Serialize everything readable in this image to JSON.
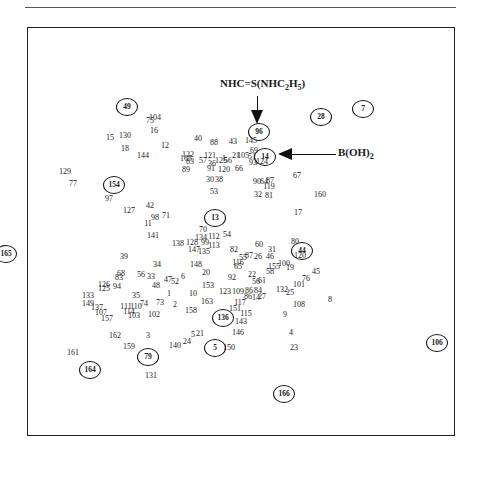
{
  "figure": {
    "annotations": {
      "top": {
        "main": "NHC=S(NHC",
        "sub1": "2",
        "mid": "H",
        "sub2": "5",
        "end": ")"
      },
      "right": {
        "main": "B(OH)",
        "sub": "2"
      }
    }
  },
  "chart_data": {
    "type": "scatter",
    "title": "",
    "xlabel": "",
    "ylabel": "",
    "grid": false,
    "legend": "none",
    "annotations": [
      {
        "text": "NHC=S(NHC2H5)",
        "points_to": "96"
      },
      {
        "text": "B(OH)2",
        "points_to": "14"
      }
    ],
    "points": [
      {
        "label": "49",
        "x": 127,
        "y": 107,
        "circled": true
      },
      {
        "label": "104",
        "x": 155,
        "y": 118
      },
      {
        "label": "75",
        "x": 150,
        "y": 121
      },
      {
        "label": "16",
        "x": 154,
        "y": 131
      },
      {
        "label": "15",
        "x": 110,
        "y": 138
      },
      {
        "label": "130",
        "x": 125,
        "y": 136
      },
      {
        "label": "12",
        "x": 165,
        "y": 146
      },
      {
        "label": "18",
        "x": 125,
        "y": 149
      },
      {
        "label": "144",
        "x": 143,
        "y": 156
      },
      {
        "label": "40",
        "x": 198,
        "y": 139
      },
      {
        "label": "88",
        "x": 214,
        "y": 143
      },
      {
        "label": "43",
        "x": 233,
        "y": 142
      },
      {
        "label": "145",
        "x": 251,
        "y": 141
      },
      {
        "label": "96",
        "x": 259,
        "y": 132,
        "circled": true
      },
      {
        "label": "28",
        "x": 321,
        "y": 117,
        "circled": true
      },
      {
        "label": "7",
        "x": 363,
        "y": 109,
        "circled": true
      },
      {
        "label": "69",
        "x": 254,
        "y": 151
      },
      {
        "label": "14",
        "x": 265,
        "y": 157,
        "circled": true
      },
      {
        "label": "122",
        "x": 188,
        "y": 155
      },
      {
        "label": "165",
        "x": 186,
        "y": 159
      },
      {
        "label": "83",
        "x": 190,
        "y": 162
      },
      {
        "label": "57",
        "x": 203,
        "y": 161
      },
      {
        "label": "121",
        "x": 210,
        "y": 156
      },
      {
        "label": "36",
        "x": 212,
        "y": 164
      },
      {
        "label": "125",
        "x": 221,
        "y": 161
      },
      {
        "label": "1",
        "x": 224,
        "y": 159
      },
      {
        "label": "56",
        "x": 228,
        "y": 161
      },
      {
        "label": "21",
        "x": 236,
        "y": 156
      },
      {
        "label": "105",
        "x": 243,
        "y": 156
      },
      {
        "label": "51",
        "x": 252,
        "y": 157
      },
      {
        "label": "93",
        "x": 253,
        "y": 163
      },
      {
        "label": "124",
        "x": 262,
        "y": 162
      },
      {
        "label": "89",
        "x": 186,
        "y": 170
      },
      {
        "label": "91",
        "x": 211,
        "y": 169
      },
      {
        "label": "120",
        "x": 224,
        "y": 170
      },
      {
        "label": "66",
        "x": 239,
        "y": 169
      },
      {
        "label": "67",
        "x": 297,
        "y": 176
      },
      {
        "label": "129",
        "x": 65,
        "y": 172
      },
      {
        "label": "77",
        "x": 73,
        "y": 184
      },
      {
        "label": "154",
        "x": 114,
        "y": 185,
        "circled": true
      },
      {
        "label": "97",
        "x": 109,
        "y": 199
      },
      {
        "label": "30",
        "x": 210,
        "y": 180
      },
      {
        "label": "38",
        "x": 219,
        "y": 180
      },
      {
        "label": "90",
        "x": 257,
        "y": 182
      },
      {
        "label": "64",
        "x": 264,
        "y": 182
      },
      {
        "label": "87",
        "x": 270,
        "y": 181
      },
      {
        "label": "119",
        "x": 269,
        "y": 187
      },
      {
        "label": "53",
        "x": 214,
        "y": 192
      },
      {
        "label": "32",
        "x": 258,
        "y": 195
      },
      {
        "label": "81",
        "x": 269,
        "y": 196
      },
      {
        "label": "160",
        "x": 320,
        "y": 195
      },
      {
        "label": "127",
        "x": 129,
        "y": 211
      },
      {
        "label": "42",
        "x": 150,
        "y": 206
      },
      {
        "label": "98",
        "x": 155,
        "y": 218
      },
      {
        "label": "71",
        "x": 166,
        "y": 216
      },
      {
        "label": "11",
        "x": 148,
        "y": 224
      },
      {
        "label": "13",
        "x": 215,
        "y": 218,
        "circled": true
      },
      {
        "label": "17",
        "x": 298,
        "y": 213
      },
      {
        "label": "141",
        "x": 153,
        "y": 236
      },
      {
        "label": "70",
        "x": 203,
        "y": 230
      },
      {
        "label": "54",
        "x": 227,
        "y": 235
      },
      {
        "label": "134",
        "x": 201,
        "y": 238
      },
      {
        "label": "112",
        "x": 214,
        "y": 237
      },
      {
        "label": "138",
        "x": 178,
        "y": 244
      },
      {
        "label": "128",
        "x": 192,
        "y": 243
      },
      {
        "label": "99",
        "x": 205,
        "y": 243
      },
      {
        "label": "113",
        "x": 214,
        "y": 246
      },
      {
        "label": "147",
        "x": 194,
        "y": 250
      },
      {
        "label": "135",
        "x": 204,
        "y": 252
      },
      {
        "label": "82",
        "x": 234,
        "y": 250
      },
      {
        "label": "60",
        "x": 259,
        "y": 245
      },
      {
        "label": "31",
        "x": 272,
        "y": 250
      },
      {
        "label": "80",
        "x": 295,
        "y": 242
      },
      {
        "label": "44",
        "x": 302,
        "y": 251,
        "circled": true
      },
      {
        "label": "120",
        "x": 300,
        "y": 256
      },
      {
        "label": "55",
        "x": 243,
        "y": 258
      },
      {
        "label": "87",
        "x": 249,
        "y": 256
      },
      {
        "label": "26",
        "x": 258,
        "y": 257
      },
      {
        "label": "46",
        "x": 270,
        "y": 257
      },
      {
        "label": "165",
        "x": 6,
        "y": 254,
        "circled": true
      },
      {
        "label": "39",
        "x": 124,
        "y": 257
      },
      {
        "label": "34",
        "x": 157,
        "y": 265
      },
      {
        "label": "148",
        "x": 196,
        "y": 265
      },
      {
        "label": "116",
        "x": 238,
        "y": 263
      },
      {
        "label": "65",
        "x": 238,
        "y": 267
      },
      {
        "label": "155",
        "x": 274,
        "y": 267
      },
      {
        "label": "100",
        "x": 284,
        "y": 264
      },
      {
        "label": "19",
        "x": 290,
        "y": 268
      },
      {
        "label": "58",
        "x": 270,
        "y": 272
      },
      {
        "label": "45",
        "x": 316,
        "y": 272
      },
      {
        "label": "68",
        "x": 121,
        "y": 274
      },
      {
        "label": "83",
        "x": 119,
        "y": 278
      },
      {
        "label": "56",
        "x": 141,
        "y": 275
      },
      {
        "label": "33",
        "x": 151,
        "y": 277
      },
      {
        "label": "47",
        "x": 168,
        "y": 280
      },
      {
        "label": "52",
        "x": 175,
        "y": 282
      },
      {
        "label": "6",
        "x": 183,
        "y": 277
      },
      {
        "label": "20",
        "x": 206,
        "y": 273
      },
      {
        "label": "92",
        "x": 232,
        "y": 278
      },
      {
        "label": "22",
        "x": 252,
        "y": 275
      },
      {
        "label": "56",
        "x": 256,
        "y": 282
      },
      {
        "label": "61",
        "x": 262,
        "y": 281
      },
      {
        "label": "76",
        "x": 306,
        "y": 279
      },
      {
        "label": "8",
        "x": 330,
        "y": 300
      },
      {
        "label": "126",
        "x": 104,
        "y": 285
      },
      {
        "label": "125",
        "x": 104,
        "y": 289
      },
      {
        "label": "94",
        "x": 117,
        "y": 287
      },
      {
        "label": "48",
        "x": 156,
        "y": 286
      },
      {
        "label": "153",
        "x": 208,
        "y": 286
      },
      {
        "label": "101",
        "x": 299,
        "y": 285
      },
      {
        "label": "132",
        "x": 282,
        "y": 290
      },
      {
        "label": "25",
        "x": 290,
        "y": 293
      },
      {
        "label": "133",
        "x": 88,
        "y": 296
      },
      {
        "label": "35",
        "x": 136,
        "y": 296
      },
      {
        "label": "1",
        "x": 169,
        "y": 294
      },
      {
        "label": "10",
        "x": 193,
        "y": 294
      },
      {
        "label": "123",
        "x": 225,
        "y": 292
      },
      {
        "label": "109",
        "x": 238,
        "y": 292
      },
      {
        "label": "86",
        "x": 249,
        "y": 291
      },
      {
        "label": "84",
        "x": 258,
        "y": 291
      },
      {
        "label": "86",
        "x": 248,
        "y": 297
      },
      {
        "label": "14",
        "x": 256,
        "y": 298
      },
      {
        "label": "27",
        "x": 262,
        "y": 297
      },
      {
        "label": "149",
        "x": 88,
        "y": 304
      },
      {
        "label": "137",
        "x": 97,
        "y": 308
      },
      {
        "label": "107",
        "x": 101,
        "y": 313
      },
      {
        "label": "157",
        "x": 107,
        "y": 319
      },
      {
        "label": "111",
        "x": 126,
        "y": 307
      },
      {
        "label": "110",
        "x": 136,
        "y": 307
      },
      {
        "label": "114",
        "x": 129,
        "y": 312
      },
      {
        "label": "74",
        "x": 144,
        "y": 304
      },
      {
        "label": "73",
        "x": 160,
        "y": 303
      },
      {
        "label": "2",
        "x": 175,
        "y": 305
      },
      {
        "label": "163",
        "x": 207,
        "y": 302
      },
      {
        "label": "103",
        "x": 134,
        "y": 316
      },
      {
        "label": "102",
        "x": 154,
        "y": 315
      },
      {
        "label": "158",
        "x": 191,
        "y": 311
      },
      {
        "label": "117",
        "x": 240,
        "y": 303
      },
      {
        "label": "151",
        "x": 235,
        "y": 309
      },
      {
        "label": "115",
        "x": 246,
        "y": 314
      },
      {
        "label": "108",
        "x": 299,
        "y": 305
      },
      {
        "label": "136",
        "x": 223,
        "y": 318,
        "circled": true
      },
      {
        "label": "143",
        "x": 241,
        "y": 322
      },
      {
        "label": "9",
        "x": 285,
        "y": 315
      },
      {
        "label": "106",
        "x": 437,
        "y": 343,
        "circled": true
      },
      {
        "label": "146",
        "x": 238,
        "y": 333
      },
      {
        "label": "4",
        "x": 291,
        "y": 333
      },
      {
        "label": "162",
        "x": 115,
        "y": 336
      },
      {
        "label": "3",
        "x": 148,
        "y": 336
      },
      {
        "label": "5",
        "x": 193,
        "y": 335
      },
      {
        "label": "21",
        "x": 200,
        "y": 334
      },
      {
        "label": "24",
        "x": 187,
        "y": 342
      },
      {
        "label": "140",
        "x": 175,
        "y": 346
      },
      {
        "label": "159",
        "x": 129,
        "y": 347
      },
      {
        "label": "5",
        "x": 215,
        "y": 348,
        "circled": true
      },
      {
        "label": "150",
        "x": 229,
        "y": 348
      },
      {
        "label": "23",
        "x": 294,
        "y": 348
      },
      {
        "label": "161",
        "x": 73,
        "y": 353
      },
      {
        "label": "79",
        "x": 148,
        "y": 357,
        "circled": true
      },
      {
        "label": "164",
        "x": 90,
        "y": 370,
        "circled": true
      },
      {
        "label": "131",
        "x": 151,
        "y": 376
      },
      {
        "label": "166",
        "x": 284,
        "y": 394,
        "circled": true
      }
    ]
  }
}
